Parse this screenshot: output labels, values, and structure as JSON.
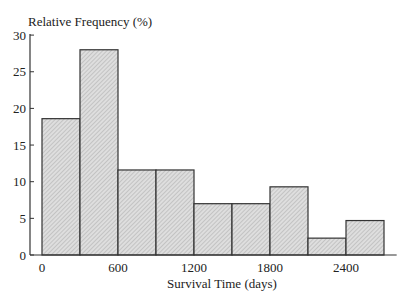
{
  "chart_data": {
    "type": "bar",
    "subtype": "histogram",
    "title": "",
    "ylabel": "Relative Frequency (%)",
    "xlabel": "Survival Time (days)",
    "bin_edges": [
      0,
      300,
      600,
      900,
      1200,
      1500,
      1800,
      2100,
      2400,
      2700
    ],
    "categories": [
      "0-300",
      "300-600",
      "600-900",
      "900-1200",
      "1200-1500",
      "1500-1800",
      "1800-2100",
      "2100-2400",
      "2400-2700"
    ],
    "values": [
      18.6,
      28.0,
      11.6,
      11.6,
      7.0,
      7.0,
      9.3,
      2.3,
      4.7
    ],
    "xticks": [
      0,
      600,
      1200,
      1800,
      2400
    ],
    "xtick_labels": [
      "0",
      "600",
      "1200",
      "1800",
      "2400"
    ],
    "yticks": [
      0,
      5,
      10,
      15,
      20,
      25,
      30
    ],
    "ytick_labels": [
      "0",
      "5",
      "10",
      "15",
      "20",
      "25",
      "30"
    ],
    "xlim": [
      -150,
      2850
    ],
    "ylim": [
      0,
      30
    ],
    "grid": false,
    "legend": null,
    "bar_fill": "#d4d4d4",
    "bar_edge": "#333333"
  }
}
